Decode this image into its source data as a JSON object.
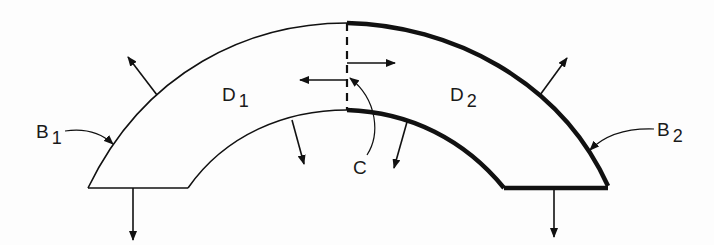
{
  "diagram": {
    "type": "domain-decomposition",
    "labels": {
      "d1": {
        "main": "D",
        "sub": "1"
      },
      "d2": {
        "main": "D",
        "sub": "2"
      },
      "b1": {
        "main": "B",
        "sub": "1"
      },
      "b2": {
        "main": "B",
        "sub": "2"
      },
      "c": {
        "main": "C"
      }
    },
    "nodes": [
      {
        "id": "D1",
        "label": "D1",
        "kind": "subdomain",
        "position": "left"
      },
      {
        "id": "D2",
        "label": "D2",
        "kind": "subdomain",
        "position": "right"
      },
      {
        "id": "B1",
        "label": "B1",
        "kind": "boundary",
        "style": "thin",
        "belongs_to": "D1"
      },
      {
        "id": "B2",
        "label": "B2",
        "kind": "boundary",
        "style": "thick",
        "belongs_to": "D2"
      },
      {
        "id": "C",
        "label": "C",
        "kind": "interface",
        "style": "dashed",
        "between": [
          "D1",
          "D2"
        ]
      }
    ],
    "colors": {
      "stroke": "#111111",
      "background": "#fdfdfd"
    }
  }
}
